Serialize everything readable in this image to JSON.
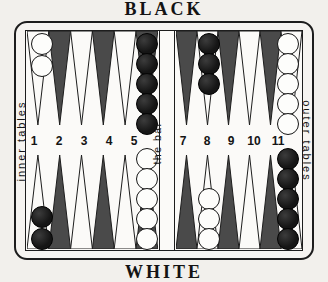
{
  "board": {
    "top_label": "BLACK",
    "bottom_label": "WHITE",
    "left_label": "inner tables",
    "right_label": "outer tables",
    "bar_label": "the bar",
    "colors": {
      "ink": "#1a1a1a",
      "paper": "#f2f0ec",
      "point_dark": "#4a4a4a",
      "point_light": "#fbfaf8",
      "checker_white": "#fdfdfb",
      "checker_black": "#151515"
    }
  },
  "point_numbers": [
    {
      "label": "1",
      "x": 34,
      "y": 134
    },
    {
      "label": "2",
      "x": 59,
      "y": 134
    },
    {
      "label": "3",
      "x": 84,
      "y": 134
    },
    {
      "label": "4",
      "x": 109,
      "y": 134
    },
    {
      "label": "5",
      "x": 134,
      "y": 134
    },
    {
      "label": "7",
      "x": 183,
      "y": 134
    },
    {
      "label": "8",
      "x": 207,
      "y": 134
    },
    {
      "label": "9",
      "x": 231,
      "y": 134
    },
    {
      "label": "10",
      "x": 254,
      "y": 134
    },
    {
      "label": "11",
      "x": 278,
      "y": 134
    }
  ],
  "quadrants": {
    "top_left": {
      "name": "black-inner-table",
      "point_fills": [
        "light",
        "dark",
        "light",
        "dark",
        "light",
        "dark"
      ]
    },
    "top_right": {
      "name": "black-outer-table",
      "point_fills": [
        "dark",
        "light",
        "dark",
        "light",
        "dark",
        "light"
      ]
    },
    "bottom_left": {
      "name": "white-inner-table",
      "point_fills": [
        "light",
        "dark",
        "light",
        "dark",
        "light",
        "dark"
      ]
    },
    "bottom_right": {
      "name": "white-outer-table",
      "point_fills": [
        "dark",
        "light",
        "dark",
        "light",
        "dark",
        "light"
      ]
    }
  },
  "checkers": [
    {
      "color": "white",
      "x": 31,
      "y": 33
    },
    {
      "color": "white",
      "x": 31,
      "y": 55
    },
    {
      "color": "black",
      "x": 136,
      "y": 33
    },
    {
      "color": "black",
      "x": 136,
      "y": 53
    },
    {
      "color": "black",
      "x": 136,
      "y": 73
    },
    {
      "color": "black",
      "x": 136,
      "y": 93
    },
    {
      "color": "black",
      "x": 136,
      "y": 113
    },
    {
      "color": "black",
      "x": 198,
      "y": 33
    },
    {
      "color": "black",
      "x": 198,
      "y": 53
    },
    {
      "color": "black",
      "x": 198,
      "y": 73
    },
    {
      "color": "white",
      "x": 277,
      "y": 33
    },
    {
      "color": "white",
      "x": 277,
      "y": 53
    },
    {
      "color": "white",
      "x": 277,
      "y": 73
    },
    {
      "color": "white",
      "x": 277,
      "y": 93
    },
    {
      "color": "white",
      "x": 277,
      "y": 113
    },
    {
      "color": "white",
      "x": 136,
      "y": 148
    },
    {
      "color": "white",
      "x": 136,
      "y": 168
    },
    {
      "color": "white",
      "x": 136,
      "y": 188
    },
    {
      "color": "white",
      "x": 136,
      "y": 208
    },
    {
      "color": "white",
      "x": 136,
      "y": 228
    },
    {
      "color": "black",
      "x": 31,
      "y": 206
    },
    {
      "color": "black",
      "x": 31,
      "y": 228
    },
    {
      "color": "white",
      "x": 198,
      "y": 188
    },
    {
      "color": "white",
      "x": 198,
      "y": 208
    },
    {
      "color": "white",
      "x": 198,
      "y": 228
    },
    {
      "color": "black",
      "x": 277,
      "y": 148
    },
    {
      "color": "black",
      "x": 277,
      "y": 168
    },
    {
      "color": "black",
      "x": 277,
      "y": 188
    },
    {
      "color": "black",
      "x": 277,
      "y": 208
    },
    {
      "color": "black",
      "x": 277,
      "y": 228
    }
  ]
}
